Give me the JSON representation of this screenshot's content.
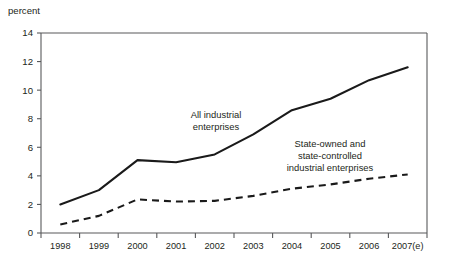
{
  "chart_data": {
    "type": "line",
    "title": "",
    "subtitle": "",
    "xlabel": "",
    "ylabel": "percent",
    "ylim": [
      0,
      14
    ],
    "ytick_values": [
      0,
      2,
      4,
      6,
      8,
      10,
      12,
      14
    ],
    "ytick_labels": [
      "0",
      "2",
      "4",
      "6",
      "8",
      "10",
      "12",
      "14"
    ],
    "grid": false,
    "legend_position": "inline-annotations",
    "categories": [
      "1998",
      "1999",
      "2000",
      "2001",
      "2002",
      "2003",
      "2004",
      "2005",
      "2006",
      "2007(e)"
    ],
    "series": [
      {
        "name": "All industrial enterprises",
        "style": "solid",
        "color": "#1a1a1a",
        "values": [
          2.0,
          3.0,
          5.1,
          4.95,
          5.5,
          6.9,
          8.6,
          9.4,
          10.7,
          11.6
        ]
      },
      {
        "name": "State-owned and state-controlled industrial enterprises",
        "style": "dashed",
        "color": "#1a1a1a",
        "values": [
          0.6,
          1.2,
          2.35,
          2.2,
          2.25,
          2.6,
          3.1,
          3.4,
          3.8,
          4.1
        ]
      }
    ],
    "annotations": [
      {
        "id": "ann-all",
        "lines": [
          "All industrial",
          "enterprises"
        ]
      },
      {
        "id": "ann-state",
        "lines": [
          "State-owned and",
          "state-controlled",
          "industrial enterprises"
        ]
      }
    ]
  }
}
